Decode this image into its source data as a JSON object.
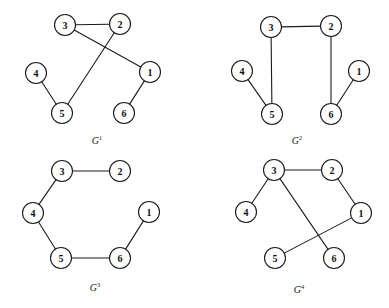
{
  "figure": {
    "background_color": "#ffffff",
    "stroke_color": "#1a1a1a",
    "node_fill": "#ffffff",
    "node_radius": 10.5,
    "width": 389,
    "height": 308
  },
  "graphs": [
    {
      "id": "G1",
      "caption_letter": "G",
      "caption_superscript": "1",
      "caption_x": 97,
      "caption_y": 140,
      "nodes": [
        {
          "label": "3",
          "x": 65,
          "y": 25
        },
        {
          "label": "2",
          "x": 120,
          "y": 24
        },
        {
          "label": "4",
          "x": 36,
          "y": 73
        },
        {
          "label": "1",
          "x": 150,
          "y": 72
        },
        {
          "label": "5",
          "x": 62,
          "y": 113
        },
        {
          "label": "6",
          "x": 124,
          "y": 113
        }
      ],
      "edges": [
        {
          "from": "3",
          "to": "2"
        },
        {
          "from": "3",
          "to": "1"
        },
        {
          "from": "2",
          "to": "5"
        },
        {
          "from": "4",
          "to": "5"
        },
        {
          "from": "1",
          "to": "6"
        }
      ]
    },
    {
      "id": "G2",
      "caption_letter": "G",
      "caption_superscript": "2",
      "caption_x": 297,
      "caption_y": 140,
      "nodes": [
        {
          "label": "3",
          "x": 271,
          "y": 27
        },
        {
          "label": "2",
          "x": 331,
          "y": 26
        },
        {
          "label": "4",
          "x": 242,
          "y": 71
        },
        {
          "label": "1",
          "x": 359,
          "y": 71
        },
        {
          "label": "5",
          "x": 272,
          "y": 114
        },
        {
          "label": "6",
          "x": 331,
          "y": 114
        }
      ],
      "edges": [
        {
          "from": "3",
          "to": "2"
        },
        {
          "from": "3",
          "to": "5"
        },
        {
          "from": "4",
          "to": "5"
        },
        {
          "from": "2",
          "to": "6"
        },
        {
          "from": "1",
          "to": "6"
        }
      ]
    },
    {
      "id": "G3",
      "caption_letter": "G",
      "caption_superscript": "3",
      "caption_x": 95,
      "caption_y": 287,
      "nodes": [
        {
          "label": "3",
          "x": 62,
          "y": 171
        },
        {
          "label": "2",
          "x": 120,
          "y": 171
        },
        {
          "label": "4",
          "x": 33,
          "y": 213
        },
        {
          "label": "1",
          "x": 149,
          "y": 212
        },
        {
          "label": "5",
          "x": 61,
          "y": 258
        },
        {
          "label": "6",
          "x": 120,
          "y": 258
        }
      ],
      "edges": [
        {
          "from": "3",
          "to": "2"
        },
        {
          "from": "3",
          "to": "4"
        },
        {
          "from": "4",
          "to": "5"
        },
        {
          "from": "5",
          "to": "6"
        },
        {
          "from": "6",
          "to": "1"
        }
      ]
    },
    {
      "id": "G4",
      "caption_letter": "G",
      "caption_superscript": "4",
      "caption_x": 299,
      "caption_y": 289,
      "nodes": [
        {
          "label": "3",
          "x": 274,
          "y": 170
        },
        {
          "label": "2",
          "x": 332,
          "y": 170
        },
        {
          "label": "4",
          "x": 246,
          "y": 212
        },
        {
          "label": "1",
          "x": 361,
          "y": 213
        },
        {
          "label": "5",
          "x": 275,
          "y": 258
        },
        {
          "label": "6",
          "x": 334,
          "y": 258
        }
      ],
      "edges": [
        {
          "from": "3",
          "to": "2"
        },
        {
          "from": "3",
          "to": "4"
        },
        {
          "from": "3",
          "to": "6"
        },
        {
          "from": "2",
          "to": "1"
        },
        {
          "from": "1",
          "to": "5"
        }
      ]
    }
  ]
}
